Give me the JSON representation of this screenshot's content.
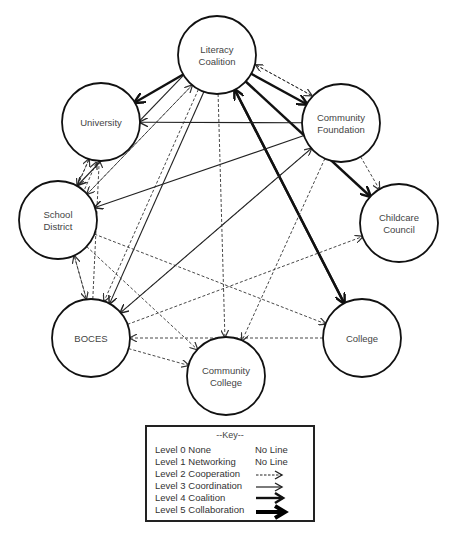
{
  "diagram": {
    "nodes": [
      {
        "id": "lc",
        "label_lines": [
          "Literacy",
          "Coalition"
        ],
        "cx": 217,
        "cy": 55,
        "r": 39
      },
      {
        "id": "uni",
        "label_lines": [
          "University"
        ],
        "cx": 101,
        "cy": 122,
        "r": 39
      },
      {
        "id": "cf",
        "label_lines": [
          "Community",
          "Foundation"
        ],
        "cx": 341,
        "cy": 123,
        "r": 39
      },
      {
        "id": "sd",
        "label_lines": [
          "School",
          "District"
        ],
        "cx": 58,
        "cy": 220,
        "r": 39
      },
      {
        "id": "cc",
        "label_lines": [
          "Childcare",
          "Council"
        ],
        "cx": 399,
        "cy": 223,
        "r": 39
      },
      {
        "id": "boces",
        "label_lines": [
          "BOCES"
        ],
        "cx": 91,
        "cy": 338,
        "r": 39
      },
      {
        "id": "college",
        "label_lines": [
          "College"
        ],
        "cx": 362,
        "cy": 338,
        "r": 39
      },
      {
        "id": "ccol",
        "label_lines": [
          "Community",
          "College"
        ],
        "cx": 226,
        "cy": 376,
        "r": 39
      }
    ],
    "edges": [
      {
        "from": "lc",
        "to": "uni",
        "level": 4
      },
      {
        "from": "lc",
        "to": "cf",
        "level": 4
      },
      {
        "from": "lc",
        "to": "cc",
        "level": 4
      },
      {
        "from": "lc",
        "to": "college",
        "level": 4
      },
      {
        "from": "college",
        "to": "lc",
        "level": 4
      },
      {
        "from": "lc",
        "to": "cf",
        "level": 2,
        "offset": -10
      },
      {
        "from": "cf",
        "to": "lc",
        "level": 2,
        "offset": 10
      },
      {
        "from": "cf",
        "to": "uni",
        "level": 3
      },
      {
        "from": "uni",
        "to": "sd",
        "level": 2,
        "offset": -4
      },
      {
        "from": "sd",
        "to": "uni",
        "level": 2,
        "offset": 4
      },
      {
        "from": "sd",
        "to": "boces",
        "level": 2,
        "offset": -6
      },
      {
        "from": "boces",
        "to": "sd",
        "level": 2,
        "offset": 6
      },
      {
        "from": "lc",
        "to": "sd",
        "level": 2,
        "offset": -3
      },
      {
        "from": "sd",
        "to": "lc",
        "level": 2,
        "offset": 3
      },
      {
        "from": "lc",
        "to": "boces",
        "level": 3,
        "offset": -3
      },
      {
        "from": "lc",
        "to": "boces",
        "level": 2,
        "offset": 3
      },
      {
        "from": "boces",
        "to": "uni",
        "level": 2
      },
      {
        "from": "cf",
        "to": "sd",
        "level": 3
      },
      {
        "from": "cf",
        "to": "boces",
        "level": 3
      },
      {
        "from": "boces",
        "to": "cf",
        "level": 2
      },
      {
        "from": "cf",
        "to": "cc",
        "level": 2
      },
      {
        "from": "cf",
        "to": "ccol",
        "level": 2
      },
      {
        "from": "lc",
        "to": "ccol",
        "level": 2
      },
      {
        "from": "sd",
        "to": "ccol",
        "level": 2
      },
      {
        "from": "sd",
        "to": "college",
        "level": 2
      },
      {
        "from": "boces",
        "to": "cc",
        "level": 2
      },
      {
        "from": "college",
        "to": "boces",
        "level": 2
      },
      {
        "from": "boces",
        "to": "ccol",
        "level": 2
      },
      {
        "from": "sd",
        "to": "uni",
        "level": 2,
        "offset": 12
      },
      {
        "from": "lc",
        "to": "sd",
        "level": 3,
        "offset": 10
      }
    ]
  },
  "key": {
    "title": "--Key--",
    "rows": [
      {
        "label": "Level 0 None",
        "symbol": "No Line"
      },
      {
        "label": "Level 1 Networking",
        "symbol": "No Line"
      },
      {
        "label": "Level 2 Cooperation",
        "symbol": "dashed-arrow"
      },
      {
        "label": "Level 3 Coordination",
        "symbol": "thin-arrow"
      },
      {
        "label": "Level 4 Coalition",
        "symbol": "medium-arrow"
      },
      {
        "label": "Level 5 Collaboration",
        "symbol": "thick-arrow"
      }
    ]
  }
}
